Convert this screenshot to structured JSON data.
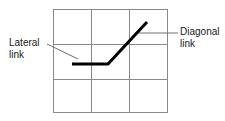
{
  "figure": {
    "type": "technical-diagram",
    "background_color": "#ffffff",
    "width": 225,
    "height": 121
  },
  "grid": {
    "name": "square-grid",
    "rows": 3,
    "columns": 3,
    "stroke_color": "#8a8a8a",
    "stroke_width": 1,
    "x_lines": [
      53,
      91,
      129,
      168
    ],
    "y_lines": [
      9,
      44,
      79,
      113
    ]
  },
  "path": {
    "name": "link-path",
    "stroke_color": "#000000",
    "stroke_width": 3,
    "points": [
      {
        "x": 72,
        "y": 64
      },
      {
        "x": 108,
        "y": 64
      },
      {
        "x": 147,
        "y": 22
      }
    ],
    "segments": [
      {
        "name": "lateral-link",
        "from": {
          "x": 72,
          "y": 64
        },
        "to": {
          "x": 108,
          "y": 64
        },
        "orientation": "horizontal"
      },
      {
        "name": "diagonal-link",
        "from": {
          "x": 108,
          "y": 64
        },
        "to": {
          "x": 147,
          "y": 22
        },
        "orientation": "diagonal"
      }
    ]
  },
  "annotations": {
    "lateral": {
      "line1": "Lateral",
      "line2": "link",
      "leader": {
        "stroke_color": "#6e6e6e",
        "stroke_width": 1,
        "from": {
          "x": 47,
          "y": 44
        },
        "to": {
          "x": 78,
          "y": 59
        }
      }
    },
    "diagonal": {
      "line1": "Diagonal",
      "line2": "link",
      "leader": {
        "stroke_color": "#6e6e6e",
        "stroke_width": 1,
        "from": {
          "x": 137,
          "y": 33
        },
        "to": {
          "x": 178,
          "y": 33
        }
      }
    }
  }
}
